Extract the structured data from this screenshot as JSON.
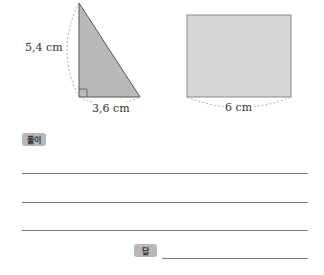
{
  "figures": {
    "triangle": {
      "height_label": "5,4 cm",
      "base_label": "3,6 cm",
      "fill": "#b9b9b9"
    },
    "rectangle": {
      "width_label": "6 cm",
      "fill": "#d6d6d6"
    }
  },
  "solution": {
    "badge_label": "풀이",
    "line_count": 3
  },
  "answer": {
    "badge_label": "답",
    "value": ""
  }
}
